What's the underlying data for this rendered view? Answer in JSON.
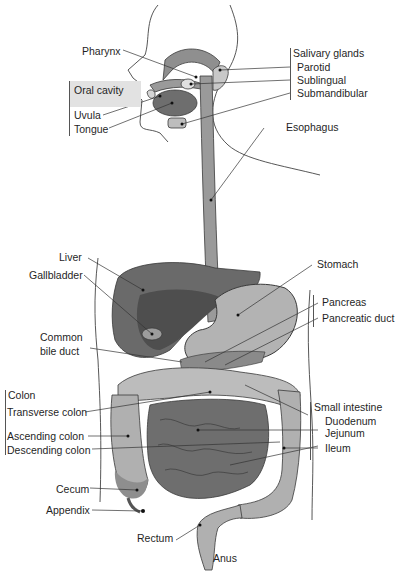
{
  "colors": {
    "organ_light": "#bdbdbd",
    "organ_mid": "#8f8f8f",
    "organ_dark": "#5e5e5e",
    "outline": "#3a3a3a",
    "oral_cavity_bg": "#e2e2e2"
  },
  "labels": {
    "pharynx": "Pharynx",
    "oral_cavity": "Oral cavity",
    "uvula": "Uvula",
    "tongue": "Tongue",
    "salivary_glands": "Salivary glands",
    "parotid": "Parotid",
    "sublingual": "Sublingual",
    "submandibular": "Submandibular",
    "esophagus": "Esophagus",
    "liver": "Liver",
    "gallbladder": "Gallbladder",
    "stomach": "Stomach",
    "pancreas": "Pancreas",
    "pancreatic_duct": "Pancreatic duct",
    "common_bile_duct_1": "Common",
    "common_bile_duct_2": "bile duct",
    "colon": "Colon",
    "transverse_colon": "Transverse colon",
    "ascending_colon": "Ascending colon",
    "descending_colon": "Descending colon",
    "cecum": "Cecum",
    "appendix": "Appendix",
    "small_intestine": "Small intestine",
    "duodenum": "Duodenum",
    "jejunum": "Jejunum",
    "ileum": "Ileum",
    "rectum": "Rectum",
    "anus": "Anus"
  }
}
